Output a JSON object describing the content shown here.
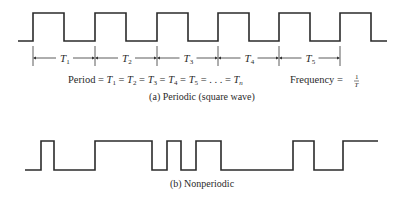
{
  "periodic": {
    "caption": "(a) Periodic (square wave)",
    "high_y": 13,
    "low_y": 41,
    "start_x": 18,
    "end_x": 387,
    "rises": [
      33,
      95,
      157,
      218,
      279,
      340
    ],
    "falls": [
      64,
      126,
      188,
      249,
      310,
      371
    ],
    "periods": [
      {
        "label": "T",
        "sub": "1"
      },
      {
        "label": "T",
        "sub": "2"
      },
      {
        "label": "T",
        "sub": "3"
      },
      {
        "label": "T",
        "sub": "4"
      },
      {
        "label": "T",
        "sub": "5"
      }
    ],
    "period_eq": {
      "prefix": "Period = ",
      "terms": [
        "T1",
        "T2",
        "T3",
        "T4",
        "T5"
      ],
      "ellipsis": ". . .",
      "last": "Tn"
    },
    "frequency_eq": {
      "prefix": "Frequency = ",
      "numerator": "1",
      "denominator": "T"
    }
  },
  "nonperiodic": {
    "caption": "(b) Nonperiodic",
    "high_y": 141,
    "low_y": 170,
    "points": [
      [
        25,
        170
      ],
      [
        41,
        170
      ],
      [
        41,
        141
      ],
      [
        54,
        141
      ],
      [
        54,
        170
      ],
      [
        95,
        170
      ],
      [
        95,
        141
      ],
      [
        152,
        141
      ],
      [
        152,
        170
      ],
      [
        167,
        170
      ],
      [
        167,
        141
      ],
      [
        181,
        141
      ],
      [
        181,
        170
      ],
      [
        196,
        170
      ],
      [
        196,
        141
      ],
      [
        221,
        141
      ],
      [
        221,
        170
      ],
      [
        293,
        170
      ],
      [
        293,
        141
      ],
      [
        314,
        141
      ],
      [
        314,
        170
      ],
      [
        343,
        170
      ],
      [
        343,
        141
      ],
      [
        378,
        141
      ]
    ]
  }
}
